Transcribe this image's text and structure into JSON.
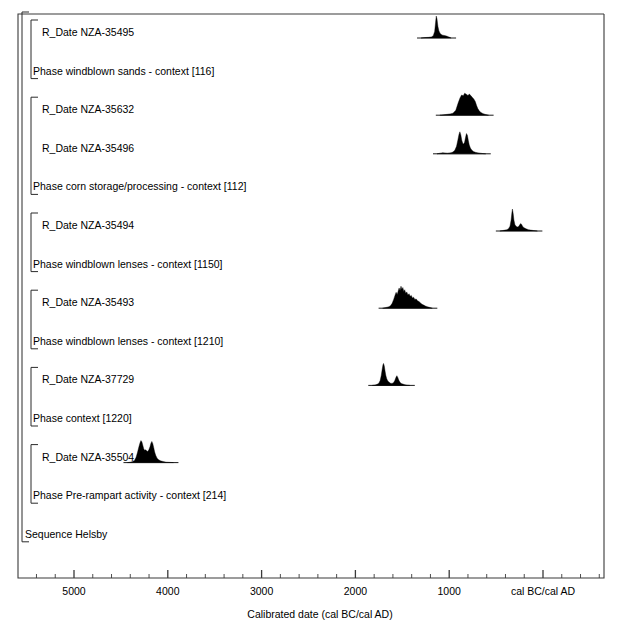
{
  "chart_data": {
    "type": "area",
    "title": "",
    "xlabel": "Calibrated date (cal BC/cal AD)",
    "ylabel": "",
    "xlim": [
      5800,
      -620
    ],
    "x_axis_direction": "reversed",
    "grid": false,
    "legend": false,
    "axis": {
      "label": "Calibrated date (cal BC/cal AD)",
      "major_ticks": [
        {
          "value": 5000,
          "label": "5000"
        },
        {
          "value": 4000,
          "label": "4000"
        },
        {
          "value": 3000,
          "label": "3000"
        },
        {
          "value": 2000,
          "label": "2000"
        },
        {
          "value": 1000,
          "label": "1000"
        },
        {
          "value": 0,
          "label": "cal BC/cal AD"
        }
      ],
      "minor_tick_step": 200,
      "units": "cal BC/cal AD"
    },
    "rows": [
      {
        "kind": "r_date",
        "label": "R_Date NZA-35495",
        "depth": 2,
        "distribution": {
          "center": 1080,
          "span": [
            1300,
            980
          ],
          "shape": "single-sharp-peak",
          "points": [
            [
              1300,
              0.0
            ],
            [
              1260,
              0.02
            ],
            [
              1220,
              0.03
            ],
            [
              1190,
              0.05
            ],
            [
              1170,
              0.1
            ],
            [
              1155,
              0.3
            ],
            [
              1145,
              0.72
            ],
            [
              1138,
              1.0
            ],
            [
              1130,
              0.86
            ],
            [
              1120,
              0.52
            ],
            [
              1110,
              0.33
            ],
            [
              1098,
              0.22
            ],
            [
              1085,
              0.16
            ],
            [
              1070,
              0.13
            ],
            [
              1050,
              0.11
            ],
            [
              1030,
              0.09
            ],
            [
              1010,
              0.06
            ],
            [
              995,
              0.03
            ],
            [
              980,
              0.0
            ]
          ]
        }
      },
      {
        "kind": "phase",
        "label": "Phase windblown sands - context [116]",
        "depth": 2,
        "distribution": null
      },
      {
        "kind": "r_date",
        "label": "R_Date NZA-35632",
        "depth": 2,
        "distribution": {
          "center": 790,
          "span": [
            1100,
            580
          ],
          "shape": "broad-plateau",
          "points": [
            [
              1100,
              0.0
            ],
            [
              1060,
              0.02
            ],
            [
              1020,
              0.04
            ],
            [
              990,
              0.06
            ],
            [
              960,
              0.09
            ],
            [
              930,
              0.22
            ],
            [
              905,
              0.55
            ],
            [
              885,
              0.78
            ],
            [
              868,
              0.92
            ],
            [
              850,
              0.88
            ],
            [
              835,
              1.0
            ],
            [
              818,
              0.95
            ],
            [
              800,
              0.9
            ],
            [
              785,
              0.96
            ],
            [
              768,
              0.88
            ],
            [
              752,
              0.8
            ],
            [
              738,
              0.74
            ],
            [
              722,
              0.62
            ],
            [
              708,
              0.44
            ],
            [
              695,
              0.3
            ],
            [
              680,
              0.2
            ],
            [
              665,
              0.13
            ],
            [
              648,
              0.09
            ],
            [
              630,
              0.06
            ],
            [
              610,
              0.03
            ],
            [
              580,
              0.0
            ]
          ]
        }
      },
      {
        "kind": "r_date",
        "label": "R_Date NZA-35496",
        "depth": 2,
        "distribution": {
          "center": 840,
          "span": [
            1130,
            610
          ],
          "shape": "twin-peak",
          "points": [
            [
              1130,
              0.0
            ],
            [
              1095,
              0.03
            ],
            [
              1070,
              0.05
            ],
            [
              1045,
              0.04
            ],
            [
              1020,
              0.03
            ],
            [
              1000,
              0.04
            ],
            [
              980,
              0.05
            ],
            [
              960,
              0.08
            ],
            [
              940,
              0.16
            ],
            [
              922,
              0.34
            ],
            [
              908,
              0.62
            ],
            [
              896,
              0.88
            ],
            [
              886,
              1.0
            ],
            [
              876,
              0.86
            ],
            [
              866,
              0.62
            ],
            [
              856,
              0.48
            ],
            [
              846,
              0.44
            ],
            [
              836,
              0.52
            ],
            [
              826,
              0.74
            ],
            [
              816,
              0.92
            ],
            [
              806,
              0.84
            ],
            [
              796,
              0.6
            ],
            [
              786,
              0.4
            ],
            [
              774,
              0.26
            ],
            [
              760,
              0.17
            ],
            [
              742,
              0.11
            ],
            [
              722,
              0.07
            ],
            [
              700,
              0.05
            ],
            [
              670,
              0.03
            ],
            [
              640,
              0.01
            ],
            [
              610,
              0.0
            ]
          ]
        }
      },
      {
        "kind": "phase",
        "label": "Phase corn storage/processing - context [112]",
        "depth": 2,
        "distribution": null
      },
      {
        "kind": "r_date",
        "label": "R_Date NZA-35494",
        "depth": 2,
        "distribution": {
          "center": 280,
          "span": [
            460,
            60
          ],
          "shape": "sharp-peak-with-tail",
          "points": [
            [
              460,
              0.0
            ],
            [
              430,
              0.02
            ],
            [
              405,
              0.04
            ],
            [
              385,
              0.06
            ],
            [
              368,
              0.1
            ],
            [
              352,
              0.22
            ],
            [
              340,
              0.5
            ],
            [
              332,
              0.82
            ],
            [
              326,
              1.0
            ],
            [
              318,
              0.8
            ],
            [
              310,
              0.5
            ],
            [
              300,
              0.3
            ],
            [
              288,
              0.22
            ],
            [
              274,
              0.18
            ],
            [
              260,
              0.2
            ],
            [
              248,
              0.28
            ],
            [
              238,
              0.34
            ],
            [
              228,
              0.3
            ],
            [
              218,
              0.22
            ],
            [
              206,
              0.16
            ],
            [
              192,
              0.12
            ],
            [
              175,
              0.09
            ],
            [
              155,
              0.06
            ],
            [
              130,
              0.04
            ],
            [
              100,
              0.02
            ],
            [
              60,
              0.0
            ]
          ]
        }
      },
      {
        "kind": "phase",
        "label": "Phase windblown lenses - context [1150]",
        "depth": 2,
        "distribution": null
      },
      {
        "kind": "r_date",
        "label": "R_Date NZA-35493",
        "depth": 2,
        "distribution": {
          "center": 1390,
          "span": [
            1710,
            1180
          ],
          "shape": "jagged-multi-peak",
          "points": [
            [
              1710,
              0.0
            ],
            [
              1675,
              0.03
            ],
            [
              1650,
              0.06
            ],
            [
              1628,
              0.1
            ],
            [
              1608,
              0.22
            ],
            [
              1592,
              0.4
            ],
            [
              1578,
              0.58
            ],
            [
              1566,
              0.72
            ],
            [
              1554,
              0.62
            ],
            [
              1544,
              0.78
            ],
            [
              1534,
              0.92
            ],
            [
              1524,
              0.8
            ],
            [
              1514,
              1.0
            ],
            [
              1504,
              0.86
            ],
            [
              1494,
              0.94
            ],
            [
              1484,
              0.76
            ],
            [
              1474,
              0.84
            ],
            [
              1464,
              0.68
            ],
            [
              1452,
              0.74
            ],
            [
              1440,
              0.6
            ],
            [
              1428,
              0.66
            ],
            [
              1416,
              0.54
            ],
            [
              1404,
              0.58
            ],
            [
              1392,
              0.46
            ],
            [
              1380,
              0.5
            ],
            [
              1366,
              0.4
            ],
            [
              1352,
              0.42
            ],
            [
              1338,
              0.34
            ],
            [
              1322,
              0.3
            ],
            [
              1306,
              0.24
            ],
            [
              1290,
              0.18
            ],
            [
              1272,
              0.14
            ],
            [
              1254,
              0.1
            ],
            [
              1234,
              0.07
            ],
            [
              1212,
              0.04
            ],
            [
              1180,
              0.0
            ]
          ]
        }
      },
      {
        "kind": "phase",
        "label": "Phase windblown lenses - context [1210]",
        "depth": 2,
        "distribution": null
      },
      {
        "kind": "r_date",
        "label": "R_Date NZA-37729",
        "depth": 2,
        "distribution": {
          "center": 1620,
          "span": [
            1820,
            1420
          ],
          "shape": "sharp-peak-plus-minor",
          "points": [
            [
              1820,
              0.0
            ],
            [
              1790,
              0.02
            ],
            [
              1768,
              0.05
            ],
            [
              1750,
              0.1
            ],
            [
              1736,
              0.22
            ],
            [
              1724,
              0.46
            ],
            [
              1714,
              0.74
            ],
            [
              1706,
              0.94
            ],
            [
              1700,
              1.0
            ],
            [
              1692,
              0.88
            ],
            [
              1684,
              0.66
            ],
            [
              1676,
              0.46
            ],
            [
              1666,
              0.3
            ],
            [
              1654,
              0.2
            ],
            [
              1640,
              0.14
            ],
            [
              1626,
              0.1
            ],
            [
              1610,
              0.09
            ],
            [
              1594,
              0.12
            ],
            [
              1580,
              0.22
            ],
            [
              1568,
              0.36
            ],
            [
              1558,
              0.44
            ],
            [
              1548,
              0.36
            ],
            [
              1538,
              0.24
            ],
            [
              1526,
              0.15
            ],
            [
              1512,
              0.09
            ],
            [
              1494,
              0.06
            ],
            [
              1472,
              0.03
            ],
            [
              1445,
              0.01
            ],
            [
              1420,
              0.0
            ]
          ]
        }
      },
      {
        "kind": "phase",
        "label": "Phase context [1220]",
        "depth": 2,
        "distribution": null
      },
      {
        "kind": "r_date",
        "label": "R_Date NZA-35504",
        "depth": 2,
        "distribution": {
          "center": 4180,
          "span": [
            4430,
            3940
          ],
          "shape": "twin-peak-plateau",
          "points": [
            [
              4430,
              0.0
            ],
            [
              4400,
              0.02
            ],
            [
              4375,
              0.05
            ],
            [
              4355,
              0.1
            ],
            [
              4338,
              0.24
            ],
            [
              4322,
              0.48
            ],
            [
              4308,
              0.72
            ],
            [
              4296,
              0.9
            ],
            [
              4286,
              1.0
            ],
            [
              4276,
              0.94
            ],
            [
              4266,
              0.78
            ],
            [
              4256,
              0.62
            ],
            [
              4246,
              0.56
            ],
            [
              4236,
              0.58
            ],
            [
              4226,
              0.54
            ],
            [
              4214,
              0.5
            ],
            [
              4202,
              0.58
            ],
            [
              4190,
              0.72
            ],
            [
              4180,
              0.88
            ],
            [
              4170,
              0.96
            ],
            [
              4160,
              0.86
            ],
            [
              4150,
              0.68
            ],
            [
              4140,
              0.48
            ],
            [
              4128,
              0.32
            ],
            [
              4114,
              0.2
            ],
            [
              4098,
              0.13
            ],
            [
              4078,
              0.08
            ],
            [
              4050,
              0.05
            ],
            [
              4015,
              0.02
            ],
            [
              3975,
              0.01
            ],
            [
              3940,
              0.0
            ]
          ]
        }
      },
      {
        "kind": "phase",
        "label": "Phase Pre-rampart activity - context [214]",
        "depth": 2,
        "distribution": null
      },
      {
        "kind": "sequence",
        "label": "Sequence Helsby",
        "depth": 1,
        "distribution": null
      }
    ],
    "brackets": [
      {
        "name": "sequence-bracket",
        "label": "Sequence Helsby",
        "depth": 1
      },
      {
        "name": "phase-bracket-116",
        "label": "Phase windblown sands - context [116]",
        "depth": 2
      },
      {
        "name": "phase-bracket-112",
        "label": "Phase corn storage/processing - context [112]",
        "depth": 2
      },
      {
        "name": "phase-bracket-1150",
        "label": "Phase windblown lenses - context [1150]",
        "depth": 2
      },
      {
        "name": "phase-bracket-1210",
        "label": "Phase windblown lenses - context [1210]",
        "depth": 2
      },
      {
        "name": "phase-bracket-1220",
        "label": "Phase context [1220]",
        "depth": 2
      },
      {
        "name": "phase-bracket-214",
        "label": "Phase Pre-rampart activity - context [214]",
        "depth": 2
      }
    ],
    "colors": {
      "distribution_fill": "#000000",
      "axis_line": "#3a3a3a",
      "bracket_line": "#2b2b2b",
      "text": "#000000",
      "background": "#ffffff"
    }
  }
}
